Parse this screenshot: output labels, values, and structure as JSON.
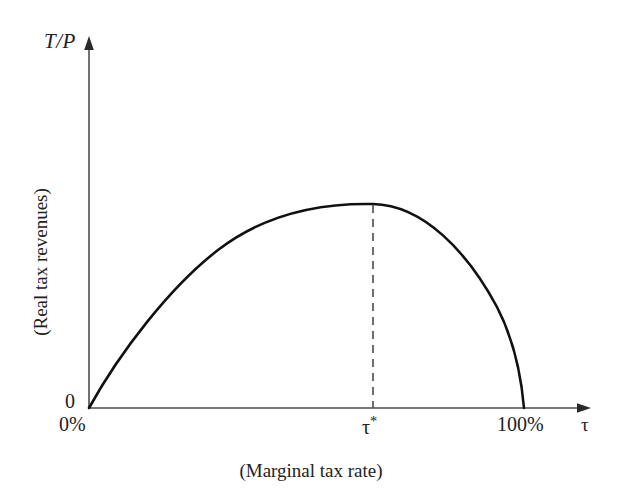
{
  "figure": {
    "background_color": "#ffffff",
    "axis_color": "#4d4d4d",
    "curve_color": "#111111",
    "dash_color": "#555555"
  },
  "axes": {
    "y_symbol": "T/P",
    "y_caption": "(Real tax revenues)",
    "x_symbol": "τ",
    "x_caption": "(Marginal tax rate)",
    "origin_label": "0"
  },
  "x_ticks": [
    {
      "label": "0%",
      "value": 0
    },
    {
      "label": "τ*",
      "value": 57
    },
    {
      "label": "100%",
      "value": 100
    }
  ],
  "chart_data": {
    "type": "line",
    "title": "",
    "subtitle": "",
    "xlabel": "(Marginal tax rate)",
    "ylabel": "(Real tax revenues)",
    "xlim": [
      0,
      100
    ],
    "ylim": [
      0,
      1.15
    ],
    "grid": false,
    "legend": null,
    "x_tick_labels": [
      "0%",
      "τ*",
      "100%"
    ],
    "x_tick_values": [
      0,
      57,
      100
    ],
    "y_tick_labels": [
      "0"
    ],
    "y_tick_values": [
      0
    ],
    "annotations": [
      {
        "name": "peak-dashed-line",
        "type": "vline",
        "x": 57,
        "y_from": 0,
        "y_to": 1.0,
        "style": "dashed",
        "label": "τ*"
      }
    ],
    "series": [
      {
        "name": "Laffer curve",
        "color": "#111111",
        "x": [
          0,
          5,
          10,
          15,
          20,
          25,
          30,
          35,
          40,
          45,
          50,
          55,
          57,
          60,
          65,
          70,
          75,
          80,
          85,
          90,
          95,
          98,
          100
        ],
        "y": [
          0.0,
          0.175,
          0.335,
          0.475,
          0.6,
          0.705,
          0.795,
          0.87,
          0.925,
          0.965,
          0.99,
          1.0,
          1.0,
          0.995,
          0.97,
          0.93,
          0.87,
          0.79,
          0.685,
          0.55,
          0.36,
          0.2,
          0.0
        ]
      }
    ]
  }
}
